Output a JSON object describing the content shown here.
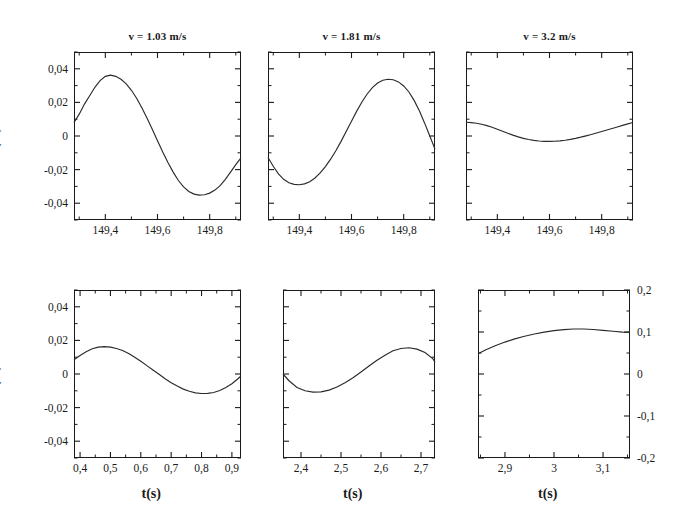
{
  "figure": {
    "ylabel_top": "X (m)",
    "ylabel_bottom": "X (m)",
    "xlabel": "t(s)"
  },
  "chart_data": [
    {
      "id": "top-left",
      "type": "line",
      "title": "v = 1.03 m/s",
      "xlabel": "",
      "ylabel": "X (m)",
      "xlim": [
        149.28,
        149.92
      ],
      "ylim": [
        -0.05,
        0.05
      ],
      "xticks": [
        149.4,
        149.6,
        149.8
      ],
      "xticklabels": [
        "149,4",
        "149,6",
        "149,8"
      ],
      "yticks": [
        -0.04,
        -0.02,
        0,
        0.02,
        0.04
      ],
      "yticklabels": [
        "-0,04",
        "-0,02",
        "0",
        "0,02",
        "0,04"
      ],
      "yaxis_side": "left",
      "grid": false,
      "x": [
        149.28,
        149.3,
        149.32,
        149.34,
        149.36,
        149.38,
        149.4,
        149.42,
        149.44,
        149.46,
        149.48,
        149.5,
        149.52,
        149.54,
        149.56,
        149.58,
        149.6,
        149.62,
        149.64,
        149.66,
        149.68,
        149.7,
        149.72,
        149.74,
        149.76,
        149.78,
        149.8,
        149.82,
        149.84,
        149.86,
        149.88,
        149.9,
        149.92
      ],
      "y": [
        0.008,
        0.013,
        0.019,
        0.024,
        0.029,
        0.033,
        0.0355,
        0.0362,
        0.0355,
        0.0338,
        0.031,
        0.0272,
        0.0225,
        0.0168,
        0.0105,
        0.004,
        -0.0028,
        -0.0095,
        -0.0158,
        -0.0215,
        -0.0265,
        -0.0303,
        -0.033,
        -0.0346,
        -0.0352,
        -0.035,
        -0.034,
        -0.0322,
        -0.0295,
        -0.0258,
        -0.0215,
        -0.017,
        -0.013
      ]
    },
    {
      "id": "top-middle",
      "type": "line",
      "title": "v = 1.81 m/s",
      "xlabel": "",
      "ylabel": "",
      "xlim": [
        149.28,
        149.92
      ],
      "ylim": [
        -0.05,
        0.05
      ],
      "xticks": [
        149.4,
        149.6,
        149.8
      ],
      "xticklabels": [
        "149,4",
        "149,6",
        "149,8"
      ],
      "yticks": [
        -0.04,
        -0.02,
        0,
        0.02,
        0.04
      ],
      "yticklabels": [],
      "yaxis_side": "none",
      "grid": false,
      "x": [
        149.28,
        149.3,
        149.32,
        149.34,
        149.36,
        149.38,
        149.4,
        149.42,
        149.44,
        149.46,
        149.48,
        149.5,
        149.52,
        149.54,
        149.56,
        149.58,
        149.6,
        149.62,
        149.64,
        149.66,
        149.68,
        149.7,
        149.72,
        149.74,
        149.76,
        149.78,
        149.8,
        149.82,
        149.84,
        149.86,
        149.88,
        149.9,
        149.92
      ],
      "y": [
        -0.0128,
        -0.018,
        -0.0225,
        -0.0258,
        -0.0278,
        -0.0288,
        -0.029,
        -0.0285,
        -0.0272,
        -0.025,
        -0.022,
        -0.0182,
        -0.0138,
        -0.0088,
        -0.0032,
        0.0028,
        0.0088,
        0.0148,
        0.0202,
        0.025,
        0.0288,
        0.0315,
        0.0332,
        0.0338,
        0.0335,
        0.0322,
        0.0298,
        0.0262,
        0.0212,
        0.015,
        0.0078,
        0.0,
        -0.0078
      ]
    },
    {
      "id": "top-right",
      "type": "line",
      "title": "v = 3.2 m/s",
      "xlabel": "",
      "ylabel": "",
      "xlim": [
        149.28,
        149.92
      ],
      "ylim": [
        -0.05,
        0.05
      ],
      "xticks": [
        149.4,
        149.6,
        149.8
      ],
      "xticklabels": [
        "149,4",
        "149,6",
        "149,8"
      ],
      "yticks": [
        -0.04,
        -0.02,
        0,
        0.02,
        0.04
      ],
      "yticklabels": [],
      "yaxis_side": "none",
      "grid": false,
      "x": [
        149.28,
        149.3,
        149.32,
        149.34,
        149.36,
        149.38,
        149.4,
        149.42,
        149.44,
        149.46,
        149.48,
        149.5,
        149.52,
        149.54,
        149.56,
        149.58,
        149.6,
        149.62,
        149.64,
        149.66,
        149.68,
        149.7,
        149.72,
        149.74,
        149.76,
        149.78,
        149.8,
        149.82,
        149.84,
        149.86,
        149.88,
        149.9,
        149.92
      ],
      "y": [
        0.0082,
        0.008,
        0.0076,
        0.007,
        0.0062,
        0.0052,
        0.004,
        0.0028,
        0.0016,
        0.0005,
        -0.0005,
        -0.0014,
        -0.0021,
        -0.0026,
        -0.003,
        -0.0032,
        -0.0032,
        -0.0031,
        -0.0029,
        -0.0025,
        -0.002,
        -0.0014,
        -0.0007,
        0.0001,
        0.0009,
        0.0018,
        0.0027,
        0.0036,
        0.0045,
        0.0054,
        0.0063,
        0.0072,
        0.008
      ]
    },
    {
      "id": "bottom-left",
      "type": "line",
      "title": "",
      "xlabel": "t(s)",
      "ylabel": "X (m)",
      "xlim": [
        0.38,
        0.93
      ],
      "ylim": [
        -0.05,
        0.05
      ],
      "xticks": [
        0.4,
        0.5,
        0.6,
        0.7,
        0.8,
        0.9
      ],
      "xticklabels": [
        "0,4",
        "0,5",
        "0,6",
        "0,7",
        "0,8",
        "0,9"
      ],
      "yticks": [
        -0.04,
        -0.02,
        0,
        0.02,
        0.04
      ],
      "yticklabels": [
        "-0,04",
        "-0,02",
        "0",
        "0,02",
        "0,04"
      ],
      "yaxis_side": "left",
      "grid": false,
      "x": [
        0.38,
        0.4,
        0.42,
        0.44,
        0.46,
        0.48,
        0.5,
        0.52,
        0.54,
        0.56,
        0.58,
        0.6,
        0.62,
        0.64,
        0.66,
        0.68,
        0.7,
        0.72,
        0.74,
        0.76,
        0.78,
        0.8,
        0.82,
        0.84,
        0.86,
        0.88,
        0.9,
        0.92,
        0.93
      ],
      "y": [
        0.0085,
        0.011,
        0.0132,
        0.015,
        0.016,
        0.0163,
        0.016,
        0.0152,
        0.014,
        0.0122,
        0.01,
        0.0076,
        0.005,
        0.0024,
        -0.0002,
        -0.0028,
        -0.0052,
        -0.0072,
        -0.009,
        -0.0103,
        -0.0112,
        -0.0116,
        -0.0115,
        -0.011,
        -0.0098,
        -0.008,
        -0.0058,
        -0.0028,
        -0.0012
      ]
    },
    {
      "id": "bottom-middle",
      "type": "line",
      "title": "",
      "xlabel": "t(s)",
      "ylabel": "",
      "xlim": [
        2.355,
        2.735
      ],
      "ylim": [
        -0.05,
        0.05
      ],
      "xticks": [
        2.4,
        2.5,
        2.6,
        2.7
      ],
      "xticklabels": [
        "2,4",
        "2,5",
        "2,6",
        "2,7"
      ],
      "yticks": [
        -0.04,
        -0.02,
        0,
        0.02,
        0.04
      ],
      "yticklabels": [],
      "yaxis_side": "none",
      "grid": false,
      "x": [
        2.355,
        2.37,
        2.39,
        2.41,
        2.43,
        2.45,
        2.47,
        2.49,
        2.51,
        2.53,
        2.55,
        2.57,
        2.59,
        2.61,
        2.63,
        2.65,
        2.67,
        2.69,
        2.71,
        2.73,
        2.735
      ],
      "y": [
        0.0,
        -0.004,
        -0.008,
        -0.01,
        -0.0108,
        -0.0106,
        -0.0096,
        -0.0078,
        -0.0052,
        -0.0022,
        0.0012,
        0.0048,
        0.0082,
        0.0112,
        0.0138,
        0.0152,
        0.0156,
        0.0148,
        0.0128,
        0.009,
        0.007
      ]
    },
    {
      "id": "bottom-right",
      "type": "line",
      "title": "",
      "xlabel": "t(s)",
      "ylabel": "",
      "xlim": [
        2.845,
        3.155
      ],
      "ylim": [
        -0.2,
        0.2
      ],
      "xticks": [
        2.9,
        3.0,
        3.1
      ],
      "xticklabels": [
        "2,9",
        "3",
        "3,1"
      ],
      "yticks": [
        -0.2,
        -0.1,
        0,
        0.1,
        0.2
      ],
      "yticklabels": [
        "-0,2",
        "-0,1",
        "0",
        "0,1",
        "0,2"
      ],
      "yaxis_side": "right",
      "grid": false,
      "x": [
        2.845,
        2.86,
        2.88,
        2.9,
        2.92,
        2.94,
        2.96,
        2.98,
        3.0,
        3.02,
        3.04,
        3.06,
        3.08,
        3.1,
        3.12,
        3.14,
        3.155
      ],
      "y": [
        0.048,
        0.057,
        0.0672,
        0.076,
        0.0836,
        0.09,
        0.0952,
        0.0996,
        0.1032,
        0.1058,
        0.1072,
        0.1072,
        0.106,
        0.104,
        0.1018,
        0.0998,
        0.099
      ]
    }
  ]
}
